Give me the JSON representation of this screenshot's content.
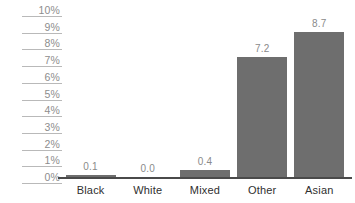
{
  "chart_data": {
    "type": "bar",
    "title": "",
    "subtitle": "",
    "xlabel": "",
    "ylabel": "",
    "categories": [
      "Black",
      "White",
      "Mixed",
      "Other",
      "Asian"
    ],
    "values": [
      0.1,
      0.0,
      0.4,
      7.2,
      8.7
    ],
    "value_labels": [
      "0.1",
      "0.0",
      "0.4",
      "7.2",
      "8.7"
    ],
    "ylim": [
      0,
      10
    ],
    "ytick_labels": [
      "10%",
      "9%",
      "8%",
      "7%",
      "6%",
      "5%",
      "4%",
      "3%",
      "2%",
      "1%",
      "0%"
    ],
    "ytick_values": [
      10,
      9,
      8,
      7,
      6,
      5,
      4,
      3,
      2,
      1,
      0
    ],
    "grid": false,
    "legend": false,
    "legend_position": "none",
    "bar_color": "#6e6e6e",
    "axis_color": "#4a4a4a",
    "tick_color": "#b9b9b9",
    "value_label_color": "#8a8a8a",
    "category_label_color": "#2f2f2f",
    "ytick_label_color": "#8d8d8d",
    "background_color": "#ffffff"
  }
}
